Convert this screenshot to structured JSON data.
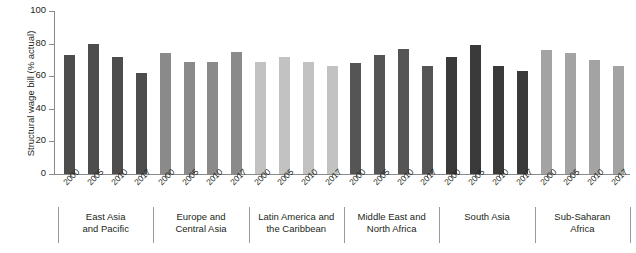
{
  "chart_data": {
    "type": "bar",
    "title": "",
    "xlabel": "",
    "ylabel": "Structural wage bill (% actual)",
    "ylim": [
      0,
      100
    ],
    "yticks": [
      0,
      20,
      40,
      60,
      80,
      100
    ],
    "ytick_labels": [
      "0",
      "20",
      "40",
      "60",
      "80",
      "100"
    ],
    "grid": false,
    "legend": "none",
    "categories": [
      "2000",
      "2005",
      "2010",
      "2017"
    ],
    "groups": [
      {
        "name": "East Asia\nand Pacific",
        "label_line1": "East Asia",
        "label_line2": "and Pacific",
        "color": "#4d4d4d",
        "values": [
          73,
          80,
          72,
          62
        ],
        "bars": [
          {
            "year": "2000",
            "value": 73
          },
          {
            "year": "2005",
            "value": 80
          },
          {
            "year": "2010",
            "value": 72
          },
          {
            "year": "2017",
            "value": 62
          }
        ]
      },
      {
        "name": "Europe and\nCentral Asia",
        "label_line1": "Europe and",
        "label_line2": "Central Asia",
        "color": "#8a8a8a",
        "values": [
          74,
          69,
          69,
          75
        ],
        "bars": [
          {
            "year": "2000",
            "value": 74
          },
          {
            "year": "2005",
            "value": 69
          },
          {
            "year": "2010",
            "value": 69
          },
          {
            "year": "2017",
            "value": 75
          }
        ]
      },
      {
        "name": "Latin America and\nthe Caribbean",
        "label_line1": "Latin America and",
        "label_line2": "the Caribbean",
        "color": "#c2c2c2",
        "values": [
          69,
          72,
          69,
          66
        ],
        "bars": [
          {
            "year": "2000",
            "value": 69
          },
          {
            "year": "2005",
            "value": 72
          },
          {
            "year": "2010",
            "value": 69
          },
          {
            "year": "2017",
            "value": 66
          }
        ]
      },
      {
        "name": "Middle East and\nNorth Africa",
        "label_line1": "Middle East and",
        "label_line2": "North Africa",
        "color": "#555555",
        "values": [
          68,
          73,
          77,
          66
        ],
        "bars": [
          {
            "year": "2000",
            "value": 68
          },
          {
            "year": "2005",
            "value": 73
          },
          {
            "year": "2010",
            "value": 77
          },
          {
            "year": "2017",
            "value": 66
          }
        ]
      },
      {
        "name": "South Asia",
        "label_line1": "South Asia",
        "label_line2": "",
        "color": "#3a3a3a",
        "values": [
          72,
          79,
          66,
          63
        ],
        "bars": [
          {
            "year": "2000",
            "value": 72
          },
          {
            "year": "2005",
            "value": 79
          },
          {
            "year": "2010",
            "value": 66
          },
          {
            "year": "2017",
            "value": 63
          }
        ]
      },
      {
        "name": "Sub-Saharan\nAfrica",
        "label_line1": "Sub-Saharan",
        "label_line2": "Africa",
        "color": "#a3a3a3",
        "values": [
          76,
          74,
          70,
          66
        ],
        "bars": [
          {
            "year": "2000",
            "value": 76
          },
          {
            "year": "2005",
            "value": 74
          },
          {
            "year": "2010",
            "value": 70
          },
          {
            "year": "2017",
            "value": 66
          }
        ]
      }
    ],
    "colors": {
      "axis": "#8a8a8a",
      "text": "#231f20",
      "background": "#ffffff"
    }
  }
}
